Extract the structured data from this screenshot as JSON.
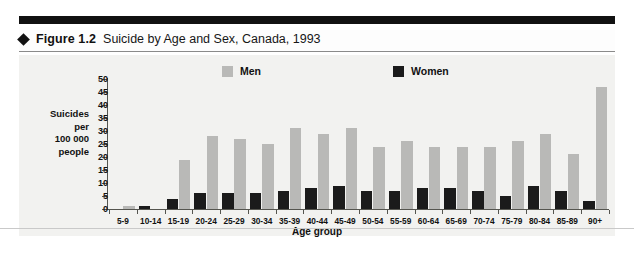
{
  "figure": {
    "bullet_icon": "diamond-bullet",
    "label": "Figure 1.2",
    "title": "Suicide by Age and Sex, Canada, 1993"
  },
  "legend": {
    "men": "Men",
    "women": "Women"
  },
  "axis": {
    "ylabel_lines": [
      "Suicides",
      "per",
      "100 000",
      "people"
    ],
    "xlabel": "Age group",
    "yticks": [
      "0",
      "5",
      "10",
      "15",
      "20",
      "25",
      "30",
      "35",
      "40",
      "45",
      "50"
    ]
  },
  "colors": {
    "men": "#b9b9b7",
    "women": "#1b1b1b",
    "panel": "#f2f2f0",
    "axis": "#55554f",
    "rule": "#111111"
  },
  "chart_data": {
    "type": "bar",
    "title": "Suicide by Age and Sex, Canada, 1993",
    "xlabel": "Age group",
    "ylabel": "Suicides per 100 000 people",
    "ylim": [
      0,
      50
    ],
    "ytick_step": 5,
    "grid": false,
    "legend_position": "top",
    "categories": [
      "5-9",
      "10-14",
      "15-19",
      "20-24",
      "25-29",
      "30-34",
      "35-39",
      "40-44",
      "45-49",
      "50-54",
      "55-59",
      "60-64",
      "65-69",
      "70-74",
      "75-79",
      "80-84",
      "85-89",
      "90+"
    ],
    "series": [
      {
        "name": "Men",
        "color": "#b9b9b7",
        "values": [
          1,
          0,
          19,
          28,
          27,
          25,
          31,
          29,
          31,
          24,
          26,
          24,
          24,
          24,
          26,
          29,
          21,
          47
        ]
      },
      {
        "name": "Women",
        "color": "#1b1b1b",
        "values": [
          0,
          1,
          4,
          6,
          6,
          6,
          7,
          8,
          9,
          7,
          7,
          8,
          8,
          7,
          5,
          9,
          7,
          3
        ]
      }
    ]
  }
}
